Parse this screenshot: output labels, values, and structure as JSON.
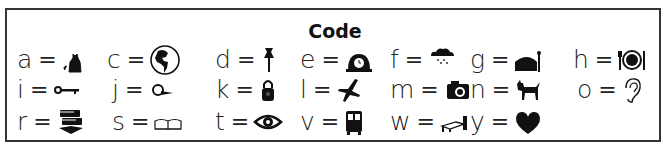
{
  "title": "Code",
  "entries": [
    {
      "letter": "a",
      "eq": "=",
      "icon": "cat-icon"
    },
    {
      "letter": "c",
      "eq": "=",
      "icon": "globe-icon"
    },
    {
      "letter": "d",
      "eq": "=",
      "icon": "pushpin-icon"
    },
    {
      "letter": "e",
      "eq": "=",
      "icon": "mantel-clock-icon"
    },
    {
      "letter": "f",
      "eq": "=",
      "icon": "rain-cloud-icon"
    },
    {
      "letter": "g",
      "eq": "=",
      "icon": "cake-icon"
    },
    {
      "letter": "h",
      "eq": "=",
      "icon": "plate-fork-knife-icon"
    },
    {
      "letter": "i",
      "eq": "=",
      "icon": "key-icon"
    },
    {
      "letter": "j",
      "eq": "=",
      "icon": "magnifier-icon"
    },
    {
      "letter": "k",
      "eq": "=",
      "icon": "padlock-icon"
    },
    {
      "letter": "l",
      "eq": "=",
      "icon": "airplane-icon"
    },
    {
      "letter": "m",
      "eq": "=",
      "icon": "camera-icon"
    },
    {
      "letter": "n",
      "eq": "=",
      "icon": "dog-icon"
    },
    {
      "letter": "o",
      "eq": "=",
      "icon": "ear-icon"
    },
    {
      "letter": "r",
      "eq": "=",
      "icon": "books-icon"
    },
    {
      "letter": "s",
      "eq": "=",
      "icon": "open-book-icon"
    },
    {
      "letter": "t",
      "eq": "=",
      "icon": "eye-icon"
    },
    {
      "letter": "v",
      "eq": "=",
      "icon": "bus-icon"
    },
    {
      "letter": "w",
      "eq": "=",
      "icon": "bed-icon"
    },
    {
      "letter": "y",
      "eq": "=",
      "icon": "heart-icon"
    }
  ]
}
